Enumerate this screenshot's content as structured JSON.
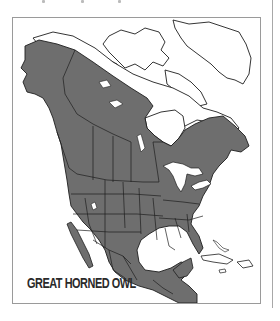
{
  "figure": {
    "title_label": "GREAT HORNED OWL",
    "type": "range-map",
    "region": "North America"
  },
  "colors": {
    "range_fill": "#6e6e6e",
    "land_fill": "#ffffff",
    "border_lines": "#1e1e1e",
    "frame_border": "#9a9a9a",
    "label_text": "#2a2a2a",
    "water": "#ffffff"
  },
  "legend": {
    "shaded_area": "year-round range"
  }
}
